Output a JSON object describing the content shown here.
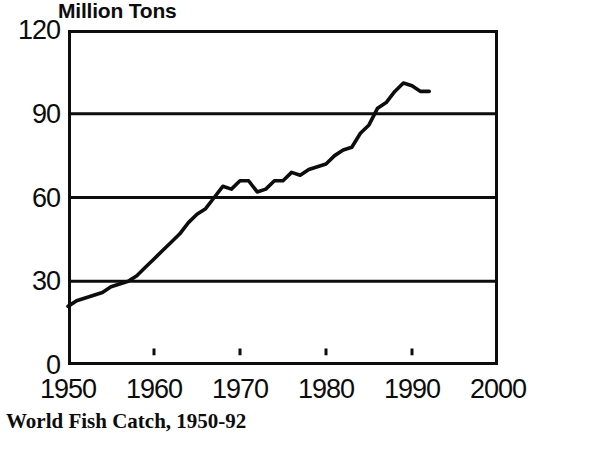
{
  "figure": {
    "caption": "World Fish Catch, 1950-92",
    "y_axis_title": "Million Tons"
  },
  "chart_data": {
    "type": "line",
    "title": "World Fish Catch, 1950-92",
    "subtitle": "",
    "xlabel": "",
    "ylabel": "Million Tons",
    "xlim": [
      1950,
      2000
    ],
    "ylim": [
      0,
      120
    ],
    "xticks": [
      1950,
      1960,
      1970,
      1980,
      1990,
      2000
    ],
    "yticks": [
      0,
      30,
      60,
      90,
      120
    ],
    "xtick_labels": [
      "1950",
      "1960",
      "1970",
      "1980",
      "1990",
      "2000"
    ],
    "ytick_labels": [
      "0",
      "30",
      "60",
      "90",
      "120"
    ],
    "grid": "horizontal gridlines at 30, 60 and 90",
    "legend": "none",
    "line_color": "#0d0d0d",
    "series": [
      {
        "name": "World Fish Catch",
        "units": "million tons",
        "x": [
          1950,
          1951,
          1952,
          1953,
          1954,
          1955,
          1956,
          1957,
          1958,
          1959,
          1960,
          1961,
          1962,
          1963,
          1964,
          1965,
          1966,
          1967,
          1968,
          1969,
          1970,
          1971,
          1972,
          1973,
          1974,
          1975,
          1976,
          1977,
          1978,
          1979,
          1980,
          1981,
          1982,
          1983,
          1984,
          1985,
          1986,
          1987,
          1988,
          1989,
          1990,
          1991,
          1992
        ],
        "values": [
          21,
          23,
          24,
          25,
          26,
          28,
          29,
          30,
          32,
          35,
          38,
          41,
          44,
          47,
          51,
          54,
          56,
          60,
          64,
          63,
          66,
          66,
          62,
          63,
          66,
          66,
          69,
          68,
          70,
          71,
          72,
          75,
          77,
          78,
          83,
          86,
          92,
          94,
          98,
          101,
          100,
          98,
          98
        ]
      }
    ]
  }
}
